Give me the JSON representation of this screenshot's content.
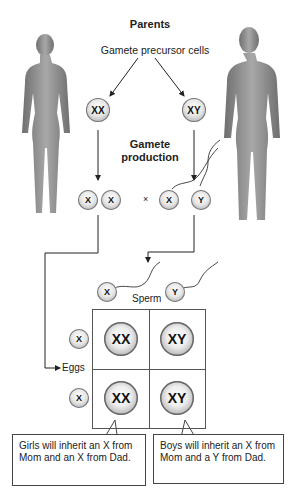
{
  "header": {
    "title": "Parents",
    "subtitle": "Gamete precursor cells"
  },
  "parents": {
    "mother": {
      "figure": "female-silhouette",
      "precursor": "XX"
    },
    "father": {
      "figure": "male-silhouette",
      "precursor": "XY"
    }
  },
  "process_label": {
    "line1": "Gamete",
    "line2": "production"
  },
  "gametes": {
    "eggs": [
      "X",
      "X"
    ],
    "cross_symbol": "×",
    "sperm": [
      "X",
      "Y"
    ]
  },
  "punnett": {
    "sperm_label": "Sperm",
    "eggs_label": "Eggs",
    "sperm_header": [
      "X",
      "Y"
    ],
    "egg_header": [
      "X",
      "X"
    ],
    "cells": [
      [
        "XX",
        "XY"
      ],
      [
        "XX",
        "XY"
      ]
    ]
  },
  "callouts": {
    "girls": "Girls will inherit an X from Mom and an X from Dad.",
    "boys": "Boys will inherit an X from Mom and a Y from Dad."
  },
  "colors": {
    "figure": "#8a8a8a",
    "line": "#333333",
    "cell_edge": "#777777"
  }
}
